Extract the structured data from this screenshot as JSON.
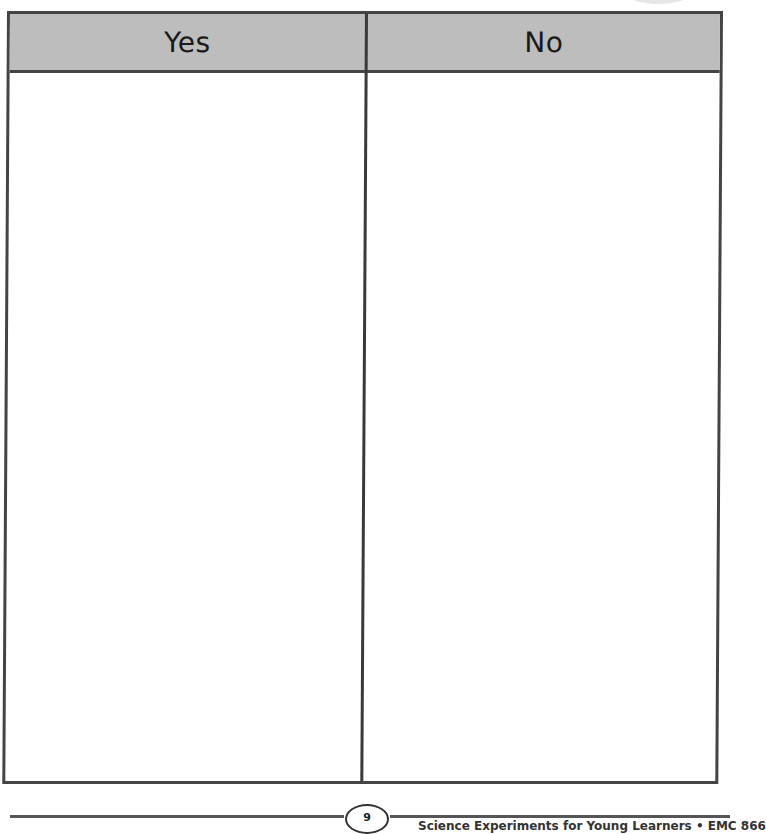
{
  "table": {
    "columns": [
      {
        "header": "Yes",
        "entries": []
      },
      {
        "header": "No",
        "entries": []
      }
    ],
    "header_bg": "#bdbdbd",
    "border_color": "#444444"
  },
  "footer": {
    "page_number": "9",
    "credit": "Science Experiments for Young Learners • EMC 866"
  }
}
